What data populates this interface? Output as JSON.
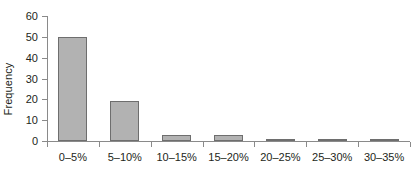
{
  "chart_data": {
    "type": "bar",
    "title": "",
    "subtitle": "",
    "xlabel": "",
    "ylabel": "Frequency",
    "categories": [
      "0–5%",
      "5–10%",
      "10–15%",
      "15–20%",
      "20–25%",
      "25–30%",
      "30–35%"
    ],
    "values": [
      50,
      19,
      3,
      3,
      1,
      1,
      1
    ],
    "ylim": [
      0,
      60
    ],
    "yticks": [
      0,
      10,
      20,
      30,
      40,
      50,
      60
    ],
    "ytick_labels": [
      "0",
      "10",
      "20",
      "30",
      "40",
      "50",
      "60"
    ],
    "grid": false,
    "legend": null,
    "legend_position": "none",
    "annotations": [],
    "bar_fill_color": "#b2b2b2",
    "bar_edge_color": "#6e6e6e",
    "axis_color": "#8a8a8a",
    "text_color": "#231f20",
    "background_color": "#ffffff"
  }
}
